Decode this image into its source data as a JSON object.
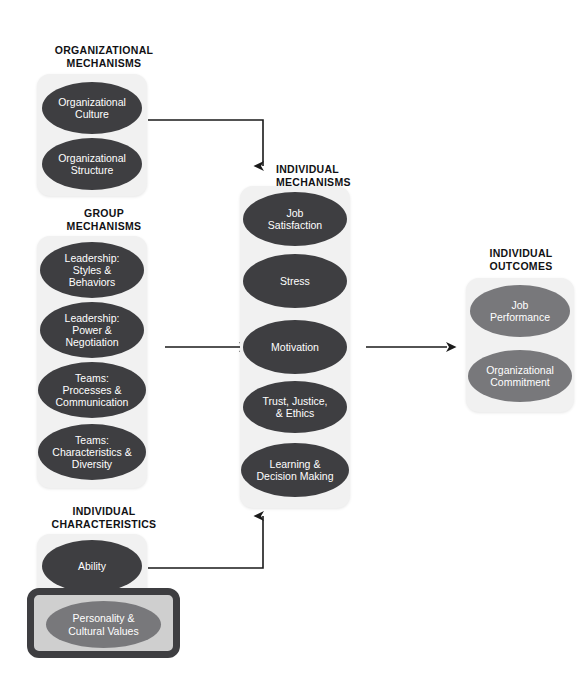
{
  "diagram": {
    "colors": {
      "oval_dark": "#3e3e41",
      "oval_mid": "#78787b",
      "panel_bg": "#f1f1f1",
      "highlight_border": "#3e3e41",
      "highlight_fill": "#cfcfcf",
      "arrow": "#1a1a1a",
      "text_heading": "#111114",
      "oval_text": "#ffffff"
    }
  },
  "sections": [
    {
      "id": "organizational-mechanisms",
      "heading": "ORGANIZATIONAL\nMECHANISMS",
      "nodes": [
        {
          "id": "organizational-culture",
          "label": "Organizational\nCulture",
          "style": "dark"
        },
        {
          "id": "organizational-structure",
          "label": "Organizational\nStructure",
          "style": "dark"
        }
      ]
    },
    {
      "id": "group-mechanisms",
      "heading": "GROUP\nMECHANISMS",
      "nodes": [
        {
          "id": "leadership-styles-behaviors",
          "label": "Leadership:\nStyles &\nBehaviors",
          "style": "dark"
        },
        {
          "id": "leadership-power-negotiation",
          "label": "Leadership:\nPower &\nNegotiation",
          "style": "dark"
        },
        {
          "id": "teams-processes-communication",
          "label": "Teams:\nProcesses &\nCommunication",
          "style": "dark"
        },
        {
          "id": "teams-characteristics-diversity",
          "label": "Teams:\nCharacteristics &\nDiversity",
          "style": "dark"
        }
      ]
    },
    {
      "id": "individual-characteristics",
      "heading": "INDIVIDUAL\nCHARACTERISTICS",
      "nodes": [
        {
          "id": "ability",
          "label": "Ability",
          "style": "dark"
        },
        {
          "id": "personality-cultural-values",
          "label": "Personality &\nCultural Values",
          "style": "mid",
          "highlighted": true
        }
      ]
    },
    {
      "id": "individual-mechanisms",
      "heading": "INDIVIDUAL\nMECHANISMS",
      "nodes": [
        {
          "id": "job-satisfaction",
          "label": "Job\nSatisfaction",
          "style": "dark"
        },
        {
          "id": "stress",
          "label": "Stress",
          "style": "dark"
        },
        {
          "id": "motivation",
          "label": "Motivation",
          "style": "dark"
        },
        {
          "id": "trust-justice-ethics",
          "label": "Trust, Justice,\n& Ethics",
          "style": "dark"
        },
        {
          "id": "learning-decision-making",
          "label": "Learning &\nDecision Making",
          "style": "dark"
        }
      ]
    },
    {
      "id": "individual-outcomes",
      "heading": "INDIVIDUAL\nOUTCOMES",
      "nodes": [
        {
          "id": "job-performance",
          "label": "Job\nPerformance",
          "style": "mid"
        },
        {
          "id": "organizational-commitment",
          "label": "Organizational\nCommitment",
          "style": "mid"
        }
      ]
    }
  ],
  "connections": [
    {
      "id": "culture-to-individual-mechanisms",
      "from": "organizational-culture",
      "to": "individual-mechanisms",
      "direction": "down"
    },
    {
      "id": "group-to-individual-mechanisms",
      "from": "group-mechanisms",
      "to": "motivation",
      "direction": "right"
    },
    {
      "id": "characteristics-to-individual-mechanisms",
      "from": "ability",
      "to": "individual-mechanisms",
      "direction": "up"
    },
    {
      "id": "individual-mechanisms-to-outcomes",
      "from": "individual-mechanisms",
      "to": "individual-outcomes",
      "direction": "right"
    }
  ]
}
